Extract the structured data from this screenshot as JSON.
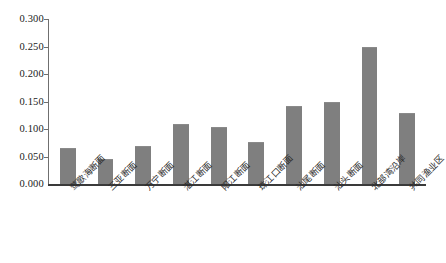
{
  "chart_data": {
    "type": "bar",
    "title": "",
    "subtitle": "",
    "xlabel": "",
    "ylabel": "",
    "grid": false,
    "legend": false,
    "legend_position": "none",
    "bar_color": "#7f7f7f",
    "axis_color": "#3a3a3a",
    "ylim": [
      0.0,
      0.3
    ],
    "ytick_values": [
      0.3,
      0.25,
      0.2,
      0.15,
      0.1,
      0.05,
      0.0
    ],
    "ytick_labels": [
      "0.300",
      "0.250",
      "0.200",
      "0.150",
      "0.100",
      "0.050",
      "0.000"
    ],
    "categories": [
      "莺歌海断面",
      "三亚断面",
      "万宁断面",
      "湛江断面",
      "阳江断面",
      "珠江口断面",
      "汕尾断面",
      "汕头断面",
      "北部湾沿岸",
      "共同渔业区"
    ],
    "values": [
      0.064,
      0.044,
      0.067,
      0.107,
      0.102,
      0.075,
      0.14,
      0.147,
      0.247,
      0.127
    ]
  }
}
